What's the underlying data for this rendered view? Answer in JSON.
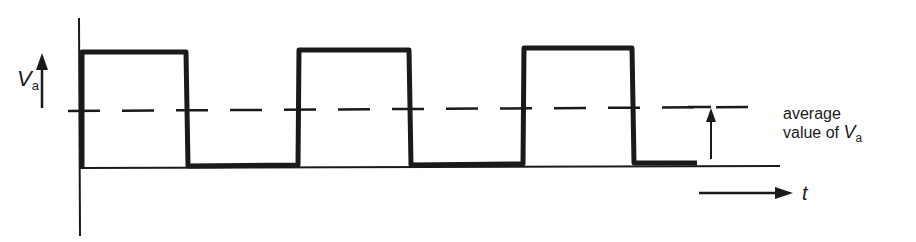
{
  "diagram": {
    "y_axis_label": {
      "symbol": "V",
      "subscript": "a"
    },
    "x_axis_label": "t",
    "average_label": {
      "line1": "average",
      "line2": "value of",
      "symbol": "V",
      "subscript": "a"
    },
    "colors": {
      "stroke": "#1a1a1a",
      "background": "#ffffff"
    },
    "waveform": {
      "type": "square-pulse-train",
      "pulses": 3,
      "levels": [
        "high",
        "low"
      ],
      "average_line": "dashed"
    }
  }
}
